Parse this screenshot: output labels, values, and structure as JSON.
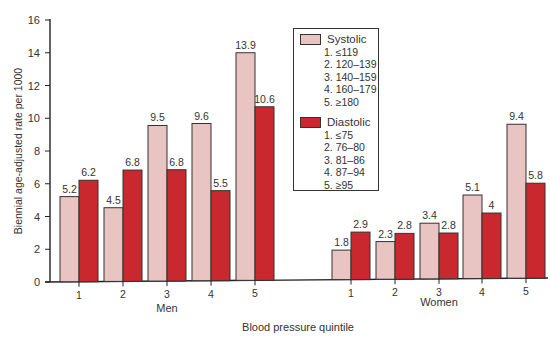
{
  "chart_data": {
    "type": "bar",
    "title": "",
    "xlabel": "Blood pressure quintile",
    "ylabel": "Biennial age-adjusted rate per 1000",
    "ylim": [
      0,
      16
    ],
    "yticks": [
      0,
      2,
      4,
      6,
      8,
      10,
      12,
      14,
      16
    ],
    "grid": false,
    "legend_position": "upper center (inside plot)",
    "groups": [
      {
        "name": "Men",
        "categories": [
          "1",
          "2",
          "3",
          "4",
          "5"
        ],
        "series": [
          {
            "name": "Systolic",
            "color": "#e8c4c2",
            "values": [
              5.2,
              4.5,
              9.5,
              9.6,
              13.9
            ]
          },
          {
            "name": "Diastolic",
            "color": "#c8282e",
            "values": [
              6.2,
              6.8,
              6.8,
              5.5,
              10.6
            ]
          }
        ]
      },
      {
        "name": "Women",
        "categories": [
          "1",
          "2",
          "3",
          "4",
          "5"
        ],
        "series": [
          {
            "name": "Systolic",
            "color": "#e8c4c2",
            "values": [
              1.8,
              2.3,
              3.4,
              5.1,
              9.4
            ]
          },
          {
            "name": "Diastolic",
            "color": "#c8282e",
            "values": [
              2.9,
              2.8,
              2.8,
              4,
              5.8
            ]
          }
        ]
      }
    ],
    "legend": [
      {
        "name": "Systolic",
        "color": "#e8c4c2",
        "items": [
          "1. ≤119",
          "2. 120–139",
          "3. 140–159",
          "4. 160–179",
          "5. ≥180"
        ]
      },
      {
        "name": "Diastolic",
        "color": "#c8282e",
        "items": [
          "1. ≤75",
          "2. 76–80",
          "3. 81–86",
          "4. 87–94",
          "5. ≥95"
        ]
      }
    ]
  },
  "labels": {
    "systolic": "Systolic",
    "diastolic": "Diastolic"
  }
}
